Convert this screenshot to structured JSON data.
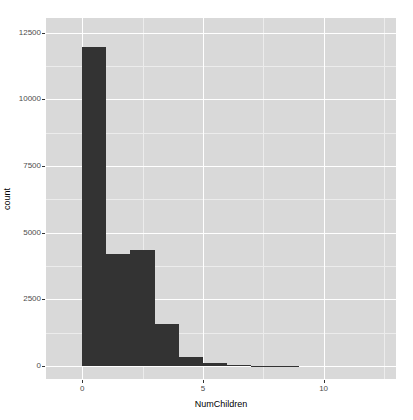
{
  "chart_data": {
    "type": "bar",
    "subtype": "histogram",
    "title": "",
    "xlabel": "NumChildren",
    "ylabel": "count",
    "xlim": [
      -1.5,
      13.0
    ],
    "ylim": [
      -480,
      13050
    ],
    "binwidth": 1,
    "grid": true,
    "legend": null,
    "legend_position": "none",
    "x_ticks": [
      0,
      5,
      10
    ],
    "x_ticklabels": [
      "0",
      "5",
      "10"
    ],
    "y_ticks": [
      0,
      2500,
      5000,
      7500,
      10000,
      12500
    ],
    "y_ticklabels": [
      "0",
      "2500",
      "5000",
      "7500",
      "10000",
      "12500"
    ],
    "y_minor_ticks": [
      1250,
      3750,
      6250,
      8750,
      11250
    ],
    "x_minor_ticks": [
      -2.5,
      2.5,
      7.5,
      12.5
    ],
    "bin_edges": [
      0,
      1,
      2,
      3,
      4,
      5,
      6,
      7,
      8,
      9
    ],
    "categories": [
      "0",
      "1",
      "2",
      "3",
      "4",
      "5",
      "6",
      "7",
      "8"
    ],
    "values": [
      11950,
      4200,
      4350,
      1600,
      350,
      120,
      50,
      15,
      5
    ],
    "bar_color": "#333333",
    "panel_color": "#d9d9d9",
    "major_grid_color": "#ffffff",
    "minor_grid_color": "#ececec",
    "axis_text_color": "#4d4d4d",
    "axis_title_color": "#000000"
  }
}
